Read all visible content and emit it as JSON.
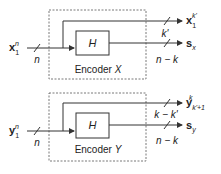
{
  "diagram": {
    "encoders": [
      {
        "name": "Encoder X",
        "label": "Encoder",
        "label_var": "X",
        "block_label": "H",
        "input": {
          "symbol": "x",
          "sub": "1",
          "sup": "n",
          "width_label": "n"
        },
        "outputs": [
          {
            "symbol": "x",
            "sub": "1",
            "sup": "k'",
            "width_label": "k'"
          },
          {
            "symbol": "s",
            "sub": "x",
            "sup": "",
            "width_label": "n − k"
          }
        ]
      },
      {
        "name": "Encoder Y",
        "label": "Encoder",
        "label_var": "Y",
        "block_label": "H",
        "input": {
          "symbol": "y",
          "sub": "1",
          "sup": "n",
          "width_label": "n"
        },
        "outputs": [
          {
            "symbol": "y",
            "sub": "k'+1",
            "sup": "k",
            "width_label": "k − k'"
          },
          {
            "symbol": "s",
            "sub": "y",
            "sup": "",
            "width_label": "n − k"
          }
        ]
      }
    ],
    "colors": {
      "line": "#333333",
      "dashed_box": "#555555",
      "text": "#222222"
    }
  }
}
